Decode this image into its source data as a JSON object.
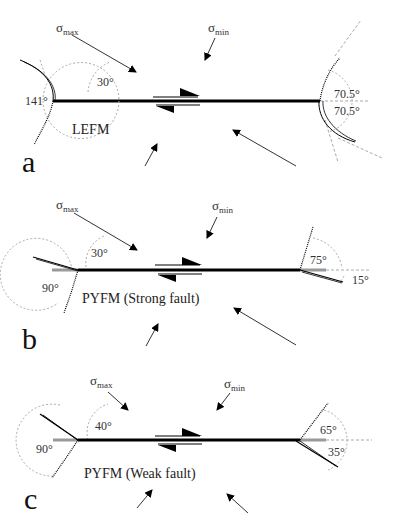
{
  "figure": {
    "panels": [
      {
        "id": "a",
        "letter": "a",
        "model_label": "LEFM",
        "sigma_max_label": "σ",
        "sigma_max_sub": "max",
        "sigma_min_label": "σ",
        "sigma_min_sub": "min",
        "stress_angle": "30°",
        "left_tip_angle": "141°",
        "right_tip_angle_upper": "70.5°",
        "right_tip_angle_lower": "70.5°"
      },
      {
        "id": "b",
        "letter": "b",
        "model_label": "PYFM (Strong fault)",
        "sigma_max_label": "σ",
        "sigma_max_sub": "max",
        "sigma_min_label": "σ",
        "sigma_min_sub": "min",
        "stress_angle": "30°",
        "left_tip_angle": "90°",
        "right_tip_angle_upper": "75°",
        "right_tip_angle_lower": "15°"
      },
      {
        "id": "c",
        "letter": "c",
        "model_label": "PYFM (Weak fault)",
        "sigma_max_label": "σ",
        "sigma_max_sub": "max",
        "sigma_min_label": "σ",
        "sigma_min_sub": "min",
        "stress_angle": "40°",
        "left_tip_angle": "90°",
        "right_tip_angle_upper": "65°",
        "right_tip_angle_lower": "35°"
      }
    ],
    "colors": {
      "fault": "#000000",
      "dashed": "#aaaaaa",
      "gray_segment": "#999999"
    }
  }
}
